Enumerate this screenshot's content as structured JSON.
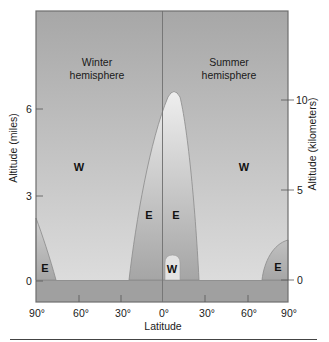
{
  "figure": {
    "hemispheres": {
      "winter": [
        "Winter",
        "hemisphere"
      ],
      "summer": [
        "Summer",
        "hemisphere"
      ]
    },
    "regions": {
      "winter_westerlies": "W",
      "summer_westerlies": "W",
      "winter_polar_easterlies": "E",
      "tropical_easterlies_left": "E",
      "tropical_easterlies_right": "E",
      "equatorial_westerlies": "W",
      "summer_polar_easterlies": "E"
    },
    "x_axis": {
      "title": "Latitude",
      "ticks": [
        "90°",
        "60°",
        "30°",
        "0°",
        "30°",
        "60°",
        "90°"
      ]
    },
    "y_axis_left": {
      "title": "Altitude (miles)",
      "ticks": [
        "0",
        "3",
        "6"
      ]
    },
    "y_axis_right": {
      "title": "Altitude (kilometers)",
      "ticks": [
        "0",
        "5",
        "10"
      ]
    },
    "colors": {
      "westerly_top": "#a7a7a7",
      "westerly_bottom": "#dcdcdc",
      "easterly_top": "#eeeeee",
      "easterly_bottom": "#a5a5a5",
      "ground": "#a0a0a0",
      "frame": "#6e6e6e"
    }
  }
}
